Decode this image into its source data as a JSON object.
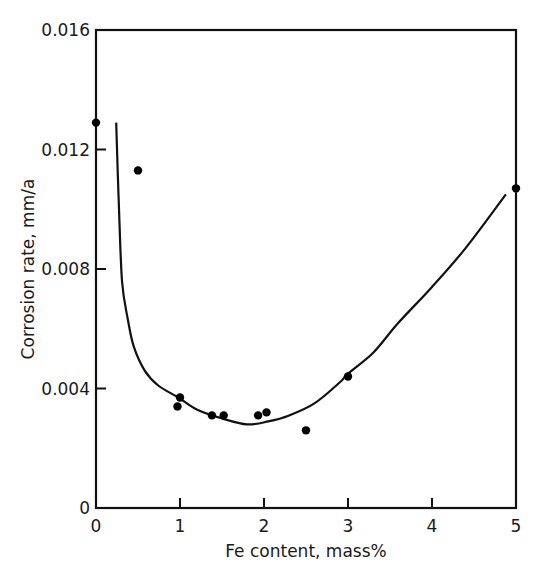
{
  "chart_data": {
    "type": "scatter",
    "title": "",
    "xlabel": "Fe content, mass%",
    "ylabel": "Corrosion rate, mm/a",
    "xlim": [
      0,
      5
    ],
    "ylim": [
      0,
      0.016
    ],
    "grid": false,
    "legend": null,
    "x_ticks": [
      0,
      1,
      2,
      3,
      4,
      5
    ],
    "x_tick_labels": [
      "0",
      "1",
      "2",
      "3",
      "4",
      "5"
    ],
    "y_ticks": [
      0,
      0.004,
      0.008,
      0.012,
      0.016
    ],
    "y_tick_labels": [
      "0",
      "0.004",
      "0.008",
      "0.012",
      "0.016"
    ],
    "series": [
      {
        "name": "Measured",
        "kind": "scatter",
        "x": [
          0.0,
          0.5,
          0.97,
          1.0,
          1.38,
          1.52,
          1.93,
          2.03,
          2.5,
          3.0,
          5.0
        ],
        "y": [
          0.0129,
          0.0113,
          0.0034,
          0.0037,
          0.0031,
          0.0031,
          0.0031,
          0.0032,
          0.0026,
          0.0044,
          0.0107
        ]
      },
      {
        "name": "Trend curve",
        "kind": "line",
        "x": [
          0.24,
          0.27,
          0.31,
          0.38,
          0.45,
          0.58,
          0.74,
          0.98,
          1.2,
          1.5,
          1.8,
          2.05,
          2.3,
          2.6,
          2.9,
          3.0,
          3.3,
          3.6,
          4.0,
          4.4,
          4.88
        ],
        "y": [
          0.0129,
          0.0103,
          0.0076,
          0.0063,
          0.0054,
          0.0046,
          0.0041,
          0.0037,
          0.0033,
          0.003,
          0.0028,
          0.0029,
          0.0031,
          0.0035,
          0.0042,
          0.0045,
          0.0052,
          0.0062,
          0.0074,
          0.0087,
          0.0105
        ]
      }
    ]
  }
}
